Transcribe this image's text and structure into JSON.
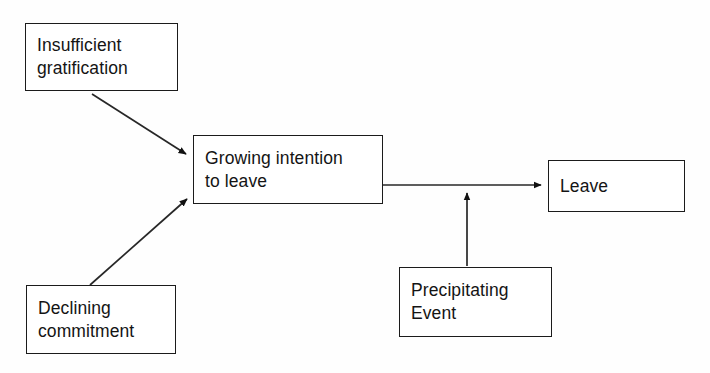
{
  "diagram": {
    "background_color": "#fefefe",
    "line_color": "#1b1b1b",
    "text_color": "#141414",
    "nodes": [
      {
        "id": "insufficient-gratification",
        "label": "Insufficient\ngratification",
        "x": 25,
        "y": 23,
        "width": 153,
        "height": 68
      },
      {
        "id": "growing-intention",
        "label": "Growing   intention\nto leave",
        "x": 193,
        "y": 135,
        "width": 190,
        "height": 69
      },
      {
        "id": "leave",
        "label": "Leave",
        "x": 548,
        "y": 160,
        "width": 137,
        "height": 52
      },
      {
        "id": "declining-commitment",
        "label": "Declining\ncommitment",
        "x": 26,
        "y": 285,
        "width": 150,
        "height": 69
      },
      {
        "id": "precipitating-event",
        "label": "Precipitating\nEvent",
        "x": 399,
        "y": 267,
        "width": 153,
        "height": 70
      }
    ],
    "edges": [
      {
        "id": "gratification-to-intention",
        "from": "insufficient-gratification",
        "to": "growing-intention",
        "kind": "diagonal-arrow",
        "x1": 92,
        "y1": 94,
        "x2": 191,
        "y2": 157
      },
      {
        "id": "commitment-to-intention",
        "from": "declining-commitment",
        "to": "growing-intention",
        "kind": "diagonal-arrow",
        "x1": 90,
        "y1": 285,
        "x2": 191,
        "y2": 196
      },
      {
        "id": "intention-to-leave",
        "from": "growing-intention",
        "to": "leave",
        "kind": "horizontal-arrow",
        "x1": 383,
        "y1": 185,
        "x2": 546,
        "y2": 185
      },
      {
        "id": "event-to-intention-leave-link",
        "from": "precipitating-event",
        "to": "intention-to-leave",
        "kind": "vertical-arrow",
        "x1": 467,
        "y1": 266,
        "x2": 467,
        "y2": 188
      }
    ]
  }
}
